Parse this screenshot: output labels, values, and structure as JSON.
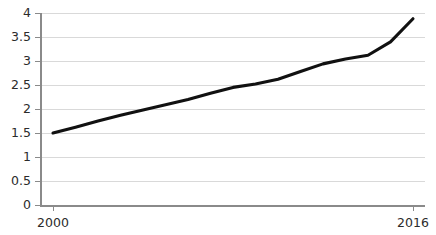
{
  "chart_data": {
    "type": "line",
    "title": "",
    "subtitle": "",
    "xlabel": "",
    "ylabel": "",
    "legend": [],
    "grid": true,
    "legend_position": "none",
    "xlim": [
      2000,
      2016
    ],
    "ylim": [
      0,
      4
    ],
    "x_tick_labels": [
      "2000",
      "2016"
    ],
    "x_ticks": [
      2000,
      2016
    ],
    "y_tick_labels": [
      "0",
      "0.5",
      "1",
      "1.5",
      "2",
      "2.5",
      "3",
      "3.5",
      "4"
    ],
    "y_ticks": [
      0,
      0.5,
      1,
      1.5,
      2,
      2.5,
      3,
      3.5,
      4
    ],
    "series": [
      {
        "name": "",
        "color": "#111111",
        "x": [
          2000,
          2001,
          2002,
          2003,
          2004,
          2005,
          2006,
          2007,
          2008,
          2009,
          2010,
          2011,
          2012,
          2013,
          2014,
          2015,
          2016
        ],
        "values": [
          1.5,
          1.62,
          1.75,
          1.87,
          1.98,
          2.09,
          2.2,
          2.33,
          2.45,
          2.52,
          2.62,
          2.78,
          2.94,
          3.04,
          3.12,
          3.4,
          3.88
        ]
      }
    ]
  },
  "axes": {
    "y_axis_color": "#8a8a8a",
    "x_axis_color": "#8a8a8a",
    "grid_color": "#d9d9d9"
  }
}
